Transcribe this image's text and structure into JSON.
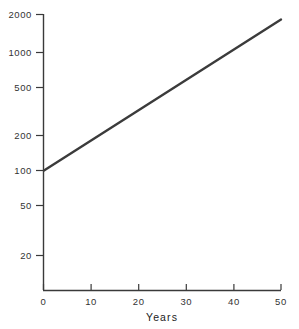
{
  "chart_data": {
    "type": "line",
    "title": "",
    "subtitle": "",
    "xlabel": "Years",
    "ylabel": "",
    "xlim": [
      0,
      50
    ],
    "ylim": [
      20,
      2000
    ],
    "yscale": "log",
    "xscale": "linear",
    "grid": false,
    "legend": null,
    "x_ticks": [
      0,
      10,
      20,
      30,
      40,
      50
    ],
    "x_tick_labels": [
      "0",
      "10",
      "20",
      "30",
      "40",
      "50"
    ],
    "y_ticks": [
      20,
      50,
      100,
      200,
      500,
      1000,
      2000
    ],
    "y_tick_labels": [
      "20",
      "50",
      "100",
      "200",
      "500",
      "1000",
      "2000"
    ],
    "series": [
      {
        "name": "growth",
        "color": "#3b3b3b",
        "x": [
          0,
          5,
          10,
          15,
          20,
          25,
          30,
          35,
          40,
          45,
          50
        ],
        "values": [
          100,
          155,
          240,
          371,
          574,
          888,
          1373,
          2124,
          3285,
          5080,
          7856
        ],
        "values_plotted": [
          100,
          155,
          240,
          371,
          574,
          888,
          1373,
          1900,
          1900,
          1900,
          1900
        ],
        "endpoints": [
          {
            "x": 0,
            "y": 100
          },
          {
            "x": 50,
            "y": 1900
          }
        ]
      }
    ],
    "annotations": [],
    "colors": {
      "line": "#3b3b3b",
      "axis": "#3a3a3a",
      "text": "#333333",
      "background": "#ffffff"
    }
  },
  "axis": {
    "x_title": "Years"
  }
}
